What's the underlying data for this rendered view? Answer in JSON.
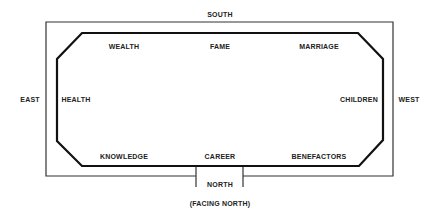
{
  "directions": {
    "south": "SOUTH",
    "north": "NORTH",
    "east": "EAST",
    "west": "WEST",
    "facing": "(FACING NORTH)"
  },
  "areas": {
    "wealth": "WEALTH",
    "fame": "FAME",
    "marriage": "MARRIAGE",
    "health": "HEALTH",
    "children": "CHILDREN",
    "knowledge": "KNOWLEDGE",
    "career": "CAREER",
    "benefactors": "BENEFACTORS"
  },
  "colors": {
    "line": "#222222",
    "background": "#ffffff"
  }
}
